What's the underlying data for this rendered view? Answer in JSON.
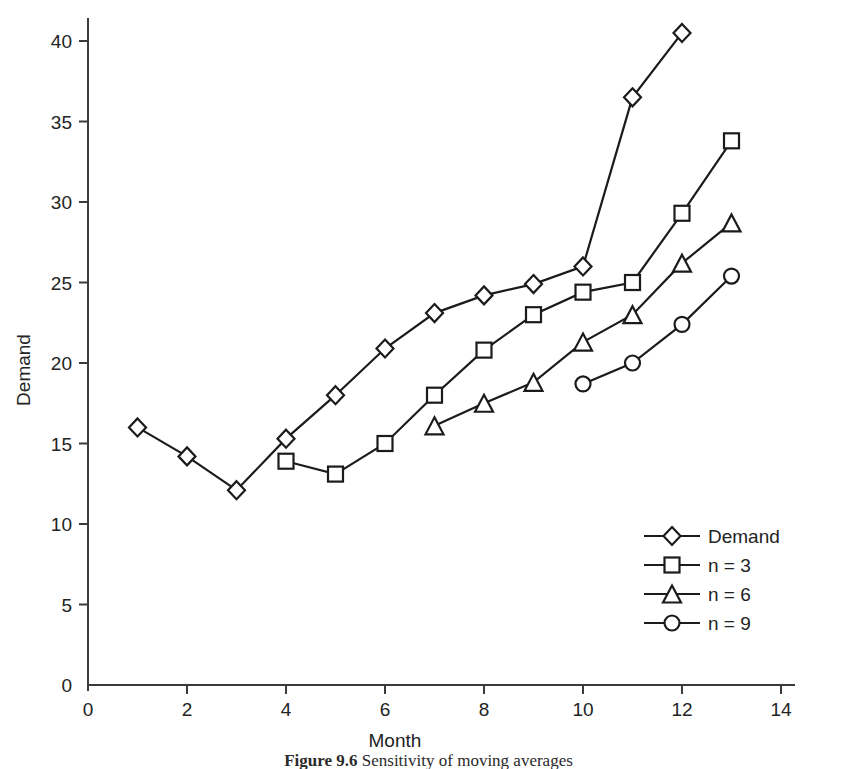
{
  "figure": {
    "caption_label": "Figure 9.6",
    "caption_text": "Sensitivity of moving averages"
  },
  "chart_data": {
    "type": "line",
    "title": "",
    "xlabel": "Month",
    "ylabel": "Demand",
    "xlim": [
      0,
      14
    ],
    "ylim": [
      0,
      41
    ],
    "xticks": [
      0,
      2,
      4,
      6,
      8,
      10,
      12,
      14
    ],
    "xtick_labels": [
      "0",
      "2",
      "4",
      "6",
      "8",
      "10",
      "12",
      "14"
    ],
    "yticks": [
      0,
      5,
      10,
      15,
      20,
      25,
      30,
      35,
      40
    ],
    "ytick_labels": [
      "0",
      "5",
      "10",
      "15",
      "20",
      "25",
      "30",
      "35",
      "40"
    ],
    "grid": false,
    "legend_position": "lower right",
    "series": [
      {
        "name": "Demand",
        "marker": "diamond",
        "x": [
          1,
          2,
          3,
          4,
          5,
          6,
          7,
          8,
          9,
          10,
          11,
          12
        ],
        "values": [
          16.0,
          14.2,
          12.1,
          15.3,
          18.0,
          20.9,
          23.1,
          24.2,
          24.9,
          26.0,
          36.5,
          40.5
        ]
      },
      {
        "name": "n = 3",
        "marker": "square",
        "x": [
          4,
          5,
          6,
          7,
          8,
          9,
          10,
          11,
          12,
          13
        ],
        "values": [
          13.9,
          13.1,
          15.0,
          18.0,
          20.8,
          23.0,
          24.4,
          25.0,
          29.3,
          33.8
        ]
      },
      {
        "name": "n = 6",
        "marker": "triangle",
        "x": [
          7,
          8,
          9,
          10,
          11,
          12,
          13
        ],
        "values": [
          16.1,
          17.5,
          18.8,
          21.3,
          23.0,
          26.2,
          28.7
        ]
      },
      {
        "name": "n = 9",
        "marker": "circle",
        "x": [
          10,
          11,
          12,
          13
        ],
        "values": [
          18.7,
          20.0,
          22.4,
          25.4
        ]
      }
    ]
  },
  "legend": {
    "entries": [
      {
        "label": "Demand",
        "marker": "diamond"
      },
      {
        "label": "n = 3",
        "marker": "square"
      },
      {
        "label": "n = 6",
        "marker": "triangle"
      },
      {
        "label": "n = 9",
        "marker": "circle"
      }
    ]
  },
  "colors": {
    "ink": "#1b1b1b",
    "axis": "#3b3b3b",
    "background": "#ffffff",
    "marker_fill": "#ffffff"
  }
}
